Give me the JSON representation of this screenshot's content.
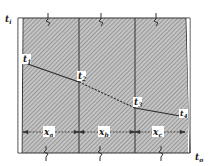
{
  "figure": {
    "type": "composite-wall-temperature-profile",
    "colors": {
      "background": "#ffffff",
      "hatch_fill": "#b8b8b8",
      "hatch_line": "#6e6e6e",
      "line": "#2a2a2a"
    },
    "labels": {
      "inside_temp": "t",
      "inside_temp_sub": "i",
      "outside_temp": "t",
      "outside_temp_sub": "o",
      "t1": "t",
      "t1_sub": "1",
      "t2": "t",
      "t2_sub": "2",
      "t3": "t",
      "t3_sub": "3",
      "t4": "t",
      "t4_sub": "4"
    },
    "layers": [
      {
        "thickness_label": "x",
        "thickness_sub": "a"
      },
      {
        "thickness_label": "x",
        "thickness_sub": "b"
      },
      {
        "thickness_label": "x",
        "thickness_sub": "c"
      }
    ],
    "temperature_profile": [
      {
        "point": "t1",
        "x": 22,
        "y": 62
      },
      {
        "point": "t2",
        "x": 79,
        "y": 82
      },
      {
        "point": "t3",
        "x": 135,
        "y": 108
      },
      {
        "point": "t4",
        "x": 186,
        "y": 117
      }
    ]
  }
}
